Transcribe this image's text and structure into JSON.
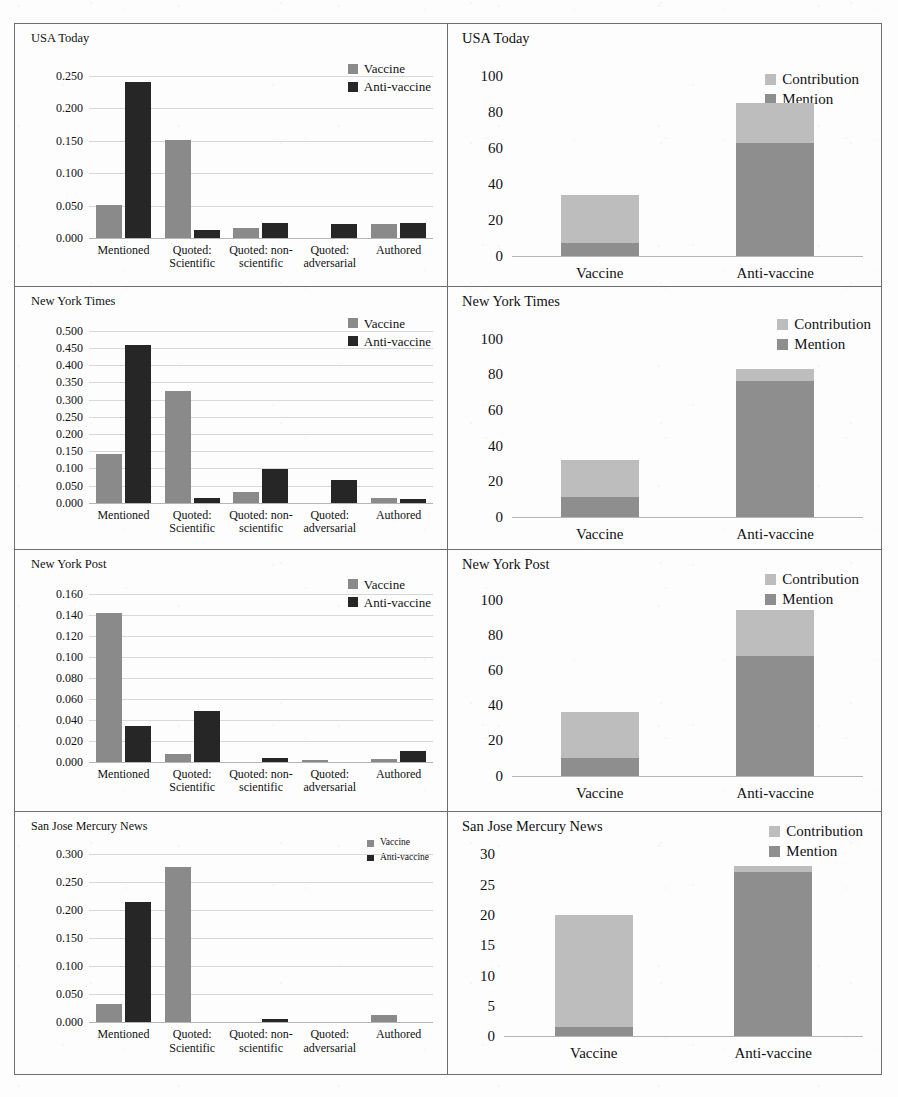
{
  "figure": {
    "colors": {
      "vaccine": "#8a8a8a",
      "anti_vaccine": "#262626",
      "contribution": "#bdbdbd",
      "mention": "#8e8e8e",
      "gridline": "#d8d8d8",
      "border": "#6e6e6e"
    },
    "legend_left": {
      "vaccine": "Vaccine",
      "anti_vaccine": "Anti-vaccine"
    },
    "legend_right": {
      "contribution": "Contribution",
      "mention": "Mention"
    },
    "categories_left": [
      "Mentioned",
      "Quoted: Scientific",
      "Quoted: non-scientific",
      "Quoted: adversarial",
      "Authored"
    ],
    "categories_left_lines": [
      [
        "Mentioned",
        ""
      ],
      [
        "Quoted:",
        "Scientific"
      ],
      [
        "Quoted: non-",
        "scientific"
      ],
      [
        "Quoted:",
        "adversarial"
      ],
      [
        "Authored",
        ""
      ]
    ],
    "categories_right": [
      "Vaccine",
      "Anti-vaccine"
    ]
  },
  "chart_data": [
    {
      "type": "bar",
      "title": "USA Today",
      "panel": "left",
      "categories": [
        "Mentioned",
        "Quoted: Scientific",
        "Quoted: non-scientific",
        "Quoted: adversarial",
        "Authored"
      ],
      "series": [
        {
          "name": "Vaccine",
          "values": [
            0.051,
            0.152,
            0.016,
            0.0,
            0.022
          ]
        },
        {
          "name": "Anti-vaccine",
          "values": [
            0.24,
            0.012,
            0.023,
            0.022,
            0.023
          ]
        }
      ],
      "ylim": [
        0.0,
        0.25
      ],
      "ytick_labels": [
        "0.000",
        "0.050",
        "0.100",
        "0.150",
        "0.200",
        "0.250"
      ],
      "ytick_values": [
        0.0,
        0.05,
        0.1,
        0.15,
        0.2,
        0.25
      ],
      "xlabel": "",
      "ylabel": "",
      "grid": true,
      "legend_position": "top-right"
    },
    {
      "type": "bar",
      "title": "USA Today",
      "panel": "right",
      "stacked": true,
      "categories": [
        "Vaccine",
        "Anti-vaccine"
      ],
      "series": [
        {
          "name": "Mention",
          "values": [
            7,
            63
          ]
        },
        {
          "name": "Contribution",
          "values": [
            27,
            22
          ]
        }
      ],
      "totals": [
        34,
        85
      ],
      "ylim": [
        0,
        100
      ],
      "ytick_labels": [
        "0",
        "20",
        "40",
        "60",
        "80",
        "100"
      ],
      "ytick_values": [
        0,
        20,
        40,
        60,
        80,
        100
      ],
      "xlabel": "",
      "ylabel": "",
      "grid": false,
      "legend_position": "top-right"
    },
    {
      "type": "bar",
      "title": "New York Times",
      "panel": "left",
      "categories": [
        "Mentioned",
        "Quoted: Scientific",
        "Quoted: non-scientific",
        "Quoted: adversarial",
        "Authored"
      ],
      "series": [
        {
          "name": "Vaccine",
          "values": [
            0.142,
            0.325,
            0.03,
            0.0,
            0.014
          ]
        },
        {
          "name": "Anti-vaccine",
          "values": [
            0.46,
            0.014,
            0.098,
            0.065,
            0.01
          ]
        }
      ],
      "ylim": [
        0.0,
        0.5
      ],
      "ytick_labels": [
        "0.000",
        "0.050",
        "0.100",
        "0.150",
        "0.200",
        "0.250",
        "0.300",
        "0.350",
        "0.400",
        "0.450",
        "0.500"
      ],
      "ytick_values": [
        0.0,
        0.05,
        0.1,
        0.15,
        0.2,
        0.25,
        0.3,
        0.35,
        0.4,
        0.45,
        0.5
      ],
      "xlabel": "",
      "ylabel": "",
      "grid": true,
      "legend_position": "top-right"
    },
    {
      "type": "bar",
      "title": "New York Times",
      "panel": "right",
      "stacked": true,
      "categories": [
        "Vaccine",
        "Anti-vaccine"
      ],
      "series": [
        {
          "name": "Mention",
          "values": [
            11,
            76
          ]
        },
        {
          "name": "Contribution",
          "values": [
            21,
            7
          ]
        }
      ],
      "totals": [
        32,
        83
      ],
      "ylim": [
        0,
        100
      ],
      "ytick_labels": [
        "0",
        "20",
        "40",
        "60",
        "80",
        "100"
      ],
      "ytick_values": [
        0,
        20,
        40,
        60,
        80,
        100
      ],
      "xlabel": "",
      "ylabel": "",
      "grid": false,
      "legend_position": "top-right"
    },
    {
      "type": "bar",
      "title": "New York Post",
      "panel": "left",
      "categories": [
        "Mentioned",
        "Quoted: Scientific",
        "Quoted: non-scientific",
        "Quoted: adversarial",
        "Authored"
      ],
      "series": [
        {
          "name": "Vaccine",
          "values": [
            0.141,
            0.007,
            0.0,
            0.001,
            0.002
          ]
        },
        {
          "name": "Anti-vaccine",
          "values": [
            0.034,
            0.048,
            0.003,
            0.0,
            0.01
          ]
        }
      ],
      "ylim": [
        0.0,
        0.16
      ],
      "ytick_labels": [
        "0.000",
        "0.020",
        "0.040",
        "0.060",
        "0.080",
        "0.100",
        "0.120",
        "0.140",
        "0.160"
      ],
      "ytick_values": [
        0.0,
        0.02,
        0.04,
        0.06,
        0.08,
        0.1,
        0.12,
        0.14,
        0.16
      ],
      "xlabel": "",
      "ylabel": "",
      "grid": true,
      "legend_position": "top-right"
    },
    {
      "type": "bar",
      "title": "New York Post",
      "panel": "right",
      "stacked": true,
      "categories": [
        "Vaccine",
        "Anti-vaccine"
      ],
      "series": [
        {
          "name": "Mention",
          "values": [
            10,
            68
          ]
        },
        {
          "name": "Contribution",
          "values": [
            26,
            26
          ]
        }
      ],
      "totals": [
        36,
        94
      ],
      "ylim": [
        0,
        100
      ],
      "ytick_labels": [
        "0",
        "20",
        "40",
        "60",
        "80",
        "100"
      ],
      "ytick_values": [
        0,
        20,
        40,
        60,
        80,
        100
      ],
      "xlabel": "",
      "ylabel": "",
      "grid": false,
      "legend_position": "top-right"
    },
    {
      "type": "bar",
      "title": "San Jose Mercury News",
      "panel": "left",
      "categories": [
        "Mentioned",
        "Quoted: Scientific",
        "Quoted: non-scientific",
        "Quoted: adversarial",
        "Authored"
      ],
      "series": [
        {
          "name": "Vaccine",
          "values": [
            0.032,
            0.277,
            0.0,
            0.0,
            0.013
          ]
        },
        {
          "name": "Anti-vaccine",
          "values": [
            0.215,
            0.0,
            0.006,
            0.0,
            0.0
          ]
        }
      ],
      "ylim": [
        0.0,
        0.3
      ],
      "ytick_labels": [
        "0.000",
        "0.050",
        "0.100",
        "0.150",
        "0.200",
        "0.250",
        "0.300"
      ],
      "ytick_values": [
        0.0,
        0.05,
        0.1,
        0.15,
        0.2,
        0.25,
        0.3
      ],
      "xlabel": "",
      "ylabel": "",
      "grid": true,
      "legend_position": "top-right"
    },
    {
      "type": "bar",
      "title": "San Jose Mercury News",
      "panel": "right",
      "stacked": true,
      "categories": [
        "Vaccine",
        "Anti-vaccine"
      ],
      "series": [
        {
          "name": "Mention",
          "values": [
            1.5,
            27
          ]
        },
        {
          "name": "Contribution",
          "values": [
            18.5,
            1
          ]
        }
      ],
      "totals": [
        20,
        28
      ],
      "ylim": [
        0,
        30
      ],
      "ytick_labels": [
        "0",
        "5",
        "10",
        "15",
        "20",
        "25",
        "30"
      ],
      "ytick_values": [
        0,
        5,
        10,
        15,
        20,
        25,
        30
      ],
      "xlabel": "",
      "ylabel": "",
      "grid": false,
      "legend_position": "top-right"
    }
  ]
}
